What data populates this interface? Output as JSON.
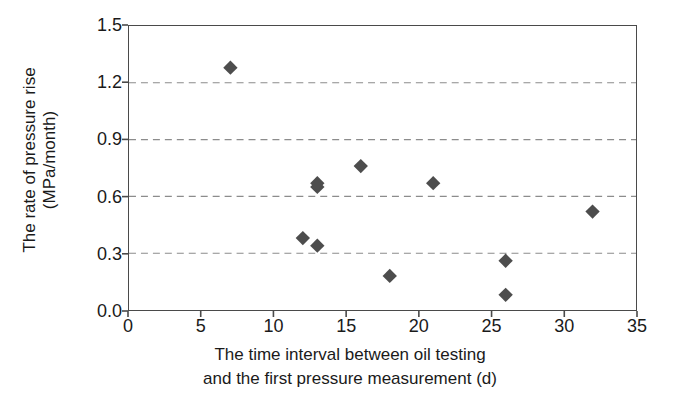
{
  "chart_data": {
    "type": "scatter",
    "title": "",
    "xlabel": "The time interval between oil testing and the first pressure measurement (d)",
    "xlabel_line1": "The time interval between oil testing",
    "xlabel_line2": "and the first pressure measurement (d)",
    "ylabel": "The rate of pressure rise (MPa/month)",
    "ylabel_line1": "The rate of pressure rise",
    "ylabel_line2": "(MPa/month)",
    "xlim": [
      0,
      35
    ],
    "ylim": [
      0.0,
      1.5
    ],
    "xticks": [
      "0",
      "5",
      "10",
      "15",
      "20",
      "25",
      "30",
      "35"
    ],
    "xtick_values": [
      0,
      5,
      10,
      15,
      20,
      25,
      30,
      35
    ],
    "yticks": [
      "0.0",
      "0.3",
      "0.6",
      "0.9",
      "1.2",
      "1.5"
    ],
    "ytick_values": [
      0.0,
      0.3,
      0.6,
      0.9,
      1.2,
      1.5
    ],
    "grid": "horizontal-dashed",
    "gridlines_y": [
      0.3,
      0.6,
      0.9,
      1.2
    ],
    "legend": null,
    "marker": "diamond",
    "marker_color": "#4d4d4d",
    "axis_color": "#4a4a4a",
    "grid_color": "#8c8c8c",
    "x": [
      7,
      12,
      13,
      13,
      13,
      16,
      18,
      21,
      26,
      26,
      32
    ],
    "y": [
      1.28,
      0.38,
      0.34,
      0.65,
      0.67,
      0.76,
      0.18,
      0.67,
      0.26,
      0.08,
      0.52
    ],
    "points": [
      {
        "x": 7,
        "y": 1.28
      },
      {
        "x": 12,
        "y": 0.38
      },
      {
        "x": 13,
        "y": 0.34
      },
      {
        "x": 13,
        "y": 0.65
      },
      {
        "x": 13,
        "y": 0.67
      },
      {
        "x": 16,
        "y": 0.76
      },
      {
        "x": 18,
        "y": 0.18
      },
      {
        "x": 21,
        "y": 0.67
      },
      {
        "x": 26,
        "y": 0.26
      },
      {
        "x": 26,
        "y": 0.08
      },
      {
        "x": 32,
        "y": 0.52
      }
    ]
  }
}
